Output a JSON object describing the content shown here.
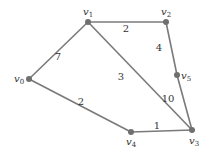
{
  "diagram": {
    "type": "weighted-undirected-graph",
    "nodes": [
      {
        "id": "v0",
        "base": "v",
        "sub": "0",
        "x": 29,
        "y": 79,
        "lx": 14,
        "ly": 82
      },
      {
        "id": "v1",
        "base": "v",
        "sub": "1",
        "x": 88,
        "y": 22,
        "lx": 83,
        "ly": 15
      },
      {
        "id": "v2",
        "base": "v",
        "sub": "2",
        "x": 166,
        "y": 22,
        "lx": 161,
        "ly": 15
      },
      {
        "id": "v3",
        "base": "v",
        "sub": "3",
        "x": 192,
        "y": 130,
        "lx": 189,
        "ly": 144
      },
      {
        "id": "v4",
        "base": "v",
        "sub": "4",
        "x": 131,
        "y": 132,
        "lx": 126,
        "ly": 145
      },
      {
        "id": "v5",
        "base": "v",
        "sub": "5",
        "x": 177,
        "y": 75,
        "lx": 181,
        "ly": 79
      }
    ],
    "edges": [
      {
        "from": "v0",
        "to": "v1",
        "weight": "7",
        "wx": 58,
        "wy": 60
      },
      {
        "from": "v1",
        "to": "v2",
        "weight": "2",
        "wx": 126,
        "wy": 32
      },
      {
        "from": "v1",
        "to": "v3",
        "weight": "3",
        "wx": 121,
        "wy": 80
      },
      {
        "from": "v2",
        "to": "v5",
        "weight": "4",
        "wx": 159,
        "wy": 51
      },
      {
        "from": "v5",
        "to": "v3",
        "weight": "10",
        "wx": 168,
        "wy": 102
      },
      {
        "from": "v0",
        "to": "v4",
        "weight": "2",
        "wx": 81,
        "wy": 105
      },
      {
        "from": "v4",
        "to": "v3",
        "weight": "1",
        "wx": 157,
        "wy": 129
      }
    ]
  }
}
